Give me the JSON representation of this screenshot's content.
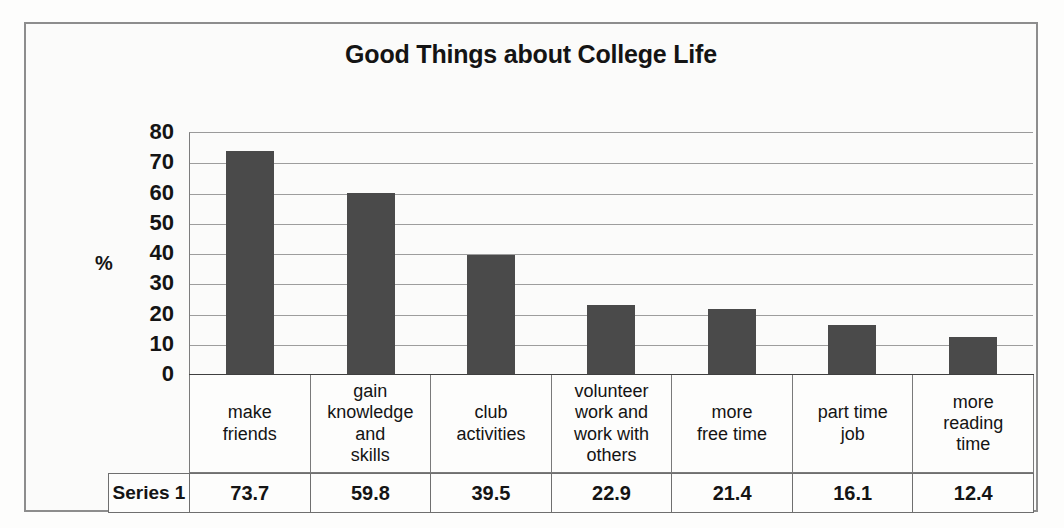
{
  "chart_data": {
    "type": "bar",
    "title": "Good Things about College Life",
    "xlabel": "",
    "ylabel": "%",
    "ylim": [
      0,
      80
    ],
    "ytick_step": 10,
    "yticks": [
      80,
      70,
      60,
      50,
      40,
      30,
      20,
      10,
      0
    ],
    "grid": true,
    "legend_position": "none",
    "categories": [
      "make friends",
      "gain knowledge and skills",
      "club activities",
      "volunteer work and work with others",
      "more free time",
      "part time job",
      "more reading time"
    ],
    "category_lines": [
      [
        "make",
        "friends"
      ],
      [
        "gain",
        "knowledge",
        "and",
        "skills"
      ],
      [
        "club",
        "activities"
      ],
      [
        "volunteer",
        "work and",
        "work with",
        "others"
      ],
      [
        "more",
        "free time"
      ],
      [
        "part time",
        "job"
      ],
      [
        "more",
        "reading",
        "time"
      ]
    ],
    "series": [
      {
        "name": "Series 1",
        "values": [
          73.7,
          59.8,
          39.5,
          22.9,
          21.4,
          16.1,
          12.4
        ]
      }
    ],
    "bar_color": "#4a4a4a",
    "gridline_color": "#9d9d9d",
    "background_color": "#fbfbfa"
  },
  "data_table": {
    "series_label": "Series 1",
    "values": [
      "73.7",
      "59.8",
      "39.5",
      "22.9",
      "21.4",
      "16.1",
      "12.4"
    ]
  }
}
